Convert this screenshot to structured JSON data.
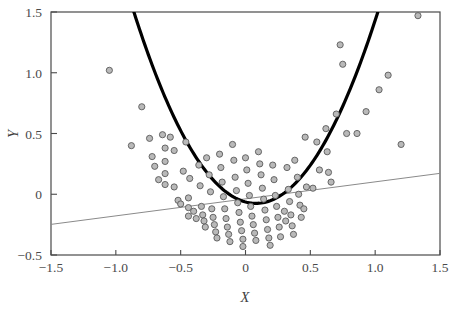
{
  "chart_data": {
    "type": "scatter",
    "title": "",
    "subtitle": "",
    "xlabel": "X",
    "ylabel": "Y",
    "xlim": [
      -1.5,
      1.5
    ],
    "ylim": [
      -0.5,
      1.5
    ],
    "xticks": [
      -1.5,
      -1.0,
      -0.5,
      0,
      0.5,
      1.0,
      1.5
    ],
    "xtick_labels": [
      "−1.5",
      "−1.0",
      "−0.5",
      "0",
      "0.5",
      "1.0",
      "1.5"
    ],
    "yticks": [
      -0.5,
      0,
      0.5,
      1.0,
      1.5
    ],
    "ytick_labels": [
      "−0.5",
      "0",
      "0.5",
      "1.0",
      "1.5"
    ],
    "grid": false,
    "legend": null,
    "legend_position": "none",
    "marker": {
      "shape": "circle",
      "radius": 3.1,
      "fill": "#b9b9b9",
      "stroke": "#5a5a5a",
      "stroke_width": 0.9
    },
    "series": [
      {
        "name": "observations",
        "type": "scatter",
        "points": [
          [
            -1.05,
            1.02
          ],
          [
            -0.88,
            0.4
          ],
          [
            -0.8,
            0.72
          ],
          [
            -0.74,
            0.46
          ],
          [
            -0.72,
            0.31
          ],
          [
            -0.7,
            0.23
          ],
          [
            -0.67,
            0.12
          ],
          [
            -0.64,
            0.49
          ],
          [
            -0.62,
            0.38
          ],
          [
            -0.62,
            0.27
          ],
          [
            -0.62,
            0.17
          ],
          [
            -0.62,
            0.08
          ],
          [
            -0.58,
            0.47
          ],
          [
            -0.55,
            0.36
          ],
          [
            -0.55,
            0.06
          ],
          [
            -0.52,
            -0.05
          ],
          [
            -0.5,
            -0.08
          ],
          [
            -0.48,
            0.19
          ],
          [
            -0.46,
            0.43
          ],
          [
            -0.44,
            -0.03
          ],
          [
            -0.44,
            -0.11
          ],
          [
            -0.44,
            -0.18
          ],
          [
            -0.43,
            0.13
          ],
          [
            -0.4,
            -0.14
          ],
          [
            -0.38,
            -0.2
          ],
          [
            -0.36,
            0.24
          ],
          [
            -0.35,
            0.07
          ],
          [
            -0.34,
            -0.1
          ],
          [
            -0.33,
            -0.17
          ],
          [
            -0.32,
            -0.22
          ],
          [
            -0.31,
            -0.27
          ],
          [
            -0.3,
            0.3
          ],
          [
            -0.28,
            0.16
          ],
          [
            -0.27,
            0.02
          ],
          [
            -0.26,
            -0.12
          ],
          [
            -0.25,
            -0.19
          ],
          [
            -0.24,
            -0.25
          ],
          [
            -0.23,
            -0.31
          ],
          [
            -0.22,
            -0.36
          ],
          [
            -0.2,
            0.33
          ],
          [
            -0.19,
            0.22
          ],
          [
            -0.18,
            0.1
          ],
          [
            -0.17,
            -0.02
          ],
          [
            -0.16,
            -0.12
          ],
          [
            -0.15,
            -0.2
          ],
          [
            -0.14,
            -0.27
          ],
          [
            -0.13,
            -0.33
          ],
          [
            -0.12,
            -0.39
          ],
          [
            -0.1,
            0.41
          ],
          [
            -0.09,
            0.28
          ],
          [
            -0.08,
            0.14
          ],
          [
            -0.07,
            0.03
          ],
          [
            -0.06,
            -0.07
          ],
          [
            -0.05,
            -0.15
          ],
          [
            -0.04,
            -0.23
          ],
          [
            -0.03,
            -0.3
          ],
          [
            -0.02,
            -0.37
          ],
          [
            -0.02,
            -0.43
          ],
          [
            0.0,
            0.3
          ],
          [
            0.01,
            0.2
          ],
          [
            0.02,
            0.09
          ],
          [
            0.03,
            -0.01
          ],
          [
            0.04,
            -0.1
          ],
          [
            0.05,
            -0.18
          ],
          [
            0.06,
            -0.25
          ],
          [
            0.07,
            -0.32
          ],
          [
            0.08,
            -0.38
          ],
          [
            0.1,
            0.35
          ],
          [
            0.11,
            0.25
          ],
          [
            0.12,
            0.16
          ],
          [
            0.13,
            0.05
          ],
          [
            0.14,
            -0.04
          ],
          [
            0.15,
            -0.13
          ],
          [
            0.16,
            -0.21
          ],
          [
            0.17,
            -0.29
          ],
          [
            0.18,
            -0.36
          ],
          [
            0.19,
            -0.42
          ],
          [
            0.21,
            0.24
          ],
          [
            0.22,
            0.12
          ],
          [
            0.23,
            -0.01
          ],
          [
            0.24,
            -0.1
          ],
          [
            0.25,
            -0.19
          ],
          [
            0.26,
            -0.27
          ],
          [
            0.27,
            -0.35
          ],
          [
            0.3,
            -0.14
          ],
          [
            0.31,
            -0.22
          ],
          [
            0.32,
            0.22
          ],
          [
            0.33,
            0.04
          ],
          [
            0.34,
            -0.06
          ],
          [
            0.35,
            -0.17
          ],
          [
            0.36,
            -0.26
          ],
          [
            0.37,
            -0.33
          ],
          [
            0.38,
            0.28
          ],
          [
            0.4,
            0.14
          ],
          [
            0.41,
            0.0
          ],
          [
            0.42,
            -0.09
          ],
          [
            0.43,
            -0.19
          ],
          [
            0.45,
            -0.12
          ],
          [
            0.46,
            0.47
          ],
          [
            0.47,
            0.06
          ],
          [
            0.52,
            0.05
          ],
          [
            0.55,
            0.43
          ],
          [
            0.57,
            0.2
          ],
          [
            0.62,
            0.54
          ],
          [
            0.63,
            0.35
          ],
          [
            0.64,
            0.18
          ],
          [
            0.66,
            0.1
          ],
          [
            0.7,
            0.66
          ],
          [
            0.73,
            1.23
          ],
          [
            0.75,
            1.07
          ],
          [
            0.78,
            0.5
          ],
          [
            0.86,
            0.5
          ],
          [
            0.93,
            0.68
          ],
          [
            1.03,
            0.86
          ],
          [
            1.1,
            0.98
          ],
          [
            1.2,
            0.41
          ],
          [
            1.33,
            1.47
          ]
        ]
      },
      {
        "name": "quadratic-fit",
        "type": "line",
        "style": "thick-black",
        "color": "#000000",
        "width": 3.2,
        "description": "quadratic curve y = a(x - h)^2 + k",
        "vertex": [
          0.08,
          -0.075
        ],
        "curvature": 1.78,
        "x_start": -1.21,
        "x_end": 1.03
      },
      {
        "name": "linear-fit",
        "type": "line",
        "style": "thin-gray",
        "color": "#8a8a8a",
        "width": 1.0,
        "description": "straight regression line across full x range",
        "endpoints": [
          [
            -1.5,
            -0.248
          ],
          [
            1.5,
            0.172
          ]
        ]
      }
    ]
  },
  "axes": {
    "x_title": "X",
    "y_title": "Y",
    "frame_color": "#4a4a4a",
    "tick_color": "#4a4a4a",
    "background": "#ffffff"
  }
}
